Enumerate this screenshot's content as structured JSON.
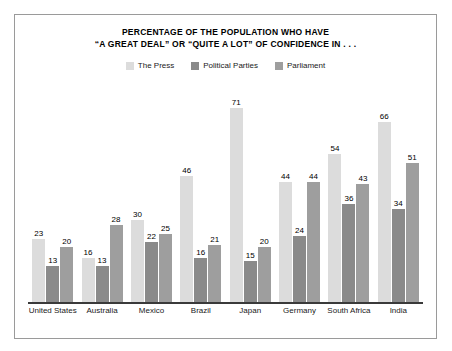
{
  "figure": {
    "title_lines": [
      "PERCENTAGE OF THE POPULATION WHO HAVE",
      "“A GREAT DEAL” OR “QUITE A LOT” OF CONFIDENCE IN . . ."
    ],
    "border_color": "#9a9a9a",
    "background": "#ffffff",
    "axis_color": "#3a3a3a"
  },
  "legend": {
    "position": "top-center",
    "items": [
      {
        "label": "The Press",
        "color": "#dcdcdc"
      },
      {
        "label": "Political Parties",
        "color": "#8a8a8a"
      },
      {
        "label": "Parliament",
        "color": "#9e9e9e"
      }
    ]
  },
  "chart_data": {
    "type": "bar",
    "title": "PERCENTAGE OF THE POPULATION WHO HAVE “A GREAT DEAL” OR “QUITE A LOT” OF CONFIDENCE IN . . .",
    "xlabel": "",
    "ylabel": "",
    "ylim": [
      0,
      75
    ],
    "grid": false,
    "legend_position": "top-center",
    "categories": [
      "United States",
      "Australia",
      "Mexico",
      "Brazil",
      "Japan",
      "Germany",
      "South Africa",
      "India"
    ],
    "series": [
      {
        "name": "The Press",
        "color": "#dcdcdc",
        "values": [
          23,
          16,
          30,
          46,
          71,
          44,
          54,
          66
        ]
      },
      {
        "name": "Political Parties",
        "color": "#8a8a8a",
        "values": [
          13,
          13,
          22,
          16,
          15,
          24,
          36,
          34
        ]
      },
      {
        "name": "Parliament",
        "color": "#9e9e9e",
        "values": [
          20,
          28,
          25,
          21,
          20,
          44,
          43,
          51
        ]
      }
    ]
  }
}
